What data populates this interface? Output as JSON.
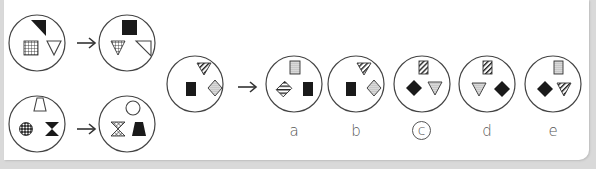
{
  "puzzle": {
    "type": "analogy-visual-reasoning",
    "examples": [
      {
        "before": [
          "black-right-triangle-top",
          "grid-square-bottom-left",
          "white-down-triangle-bottom-right"
        ],
        "after": [
          "black-square-top",
          "grid-down-triangle-bottom-left",
          "white-right-triangle-bottom-right"
        ]
      },
      {
        "before": [
          "white-trapezoid-top",
          "checkered-circle-bottom-left",
          "black-hourglass-bottom-right"
        ],
        "after": [
          "white-circle-top",
          "checkered-hourglass-bottom-left",
          "black-trapezoid-bottom-right"
        ]
      }
    ],
    "question": {
      "before": [
        "striped-down-triangle-top",
        "black-rectangle-bottom-left",
        "dotted-diamond-bottom-right"
      ]
    },
    "options": [
      {
        "label": "a",
        "shapes": [
          "dotted-rectangle-top",
          "striped-diamond-left",
          "black-rectangle-right"
        ]
      },
      {
        "label": "b",
        "shapes": [
          "striped-down-triangle-top",
          "black-rectangle-left",
          "dotted-diamond-right"
        ]
      },
      {
        "label": "c",
        "shapes": [
          "striped-rectangle-top",
          "black-diamond-left",
          "dotted-down-triangle-right"
        ]
      },
      {
        "label": "d",
        "shapes": [
          "striped-rectangle-top",
          "dotted-down-triangle-left",
          "black-diamond-right"
        ]
      },
      {
        "label": "e",
        "shapes": [
          "dotted-rectangle-top",
          "black-diamond-left",
          "striped-down-triangle-right"
        ]
      }
    ],
    "selected_answer": "c",
    "arrow_symbol": "→"
  },
  "labels": {
    "a": "a",
    "b": "b",
    "c": "c",
    "d": "d",
    "e": "e"
  },
  "colors": {
    "line": "#444444",
    "fill_black": "#1a1a1a",
    "background": "#d9d9d9",
    "panel": "#ffffff"
  }
}
